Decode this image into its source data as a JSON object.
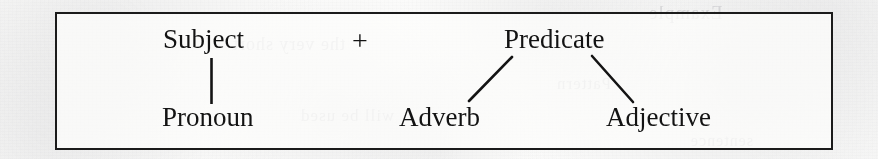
{
  "figure": {
    "type": "sentence-structure-tree",
    "caption_text": "",
    "border_color": "#1b1b1b",
    "text_color": "#131313",
    "background_color": "#fbfbfa"
  },
  "nodes": {
    "subject": "Subject",
    "plus": "+",
    "predicate": "Predicate",
    "pronoun": "Pronoun",
    "adverb": "Adverb",
    "adjective": "Adjective"
  },
  "connectors": [
    {
      "name": "subject-to-pronoun",
      "kind": "vertical",
      "from": "subject",
      "to": "pronoun"
    },
    {
      "name": "predicate-to-adverb",
      "kind": "diagonal-left",
      "from": "predicate",
      "to": "adverb"
    },
    {
      "name": "predicate-to-adjective",
      "kind": "diagonal-right",
      "from": "predicate",
      "to": "adjective"
    }
  ],
  "bleedthrough": {
    "line_a": "Example",
    "line_b": "the very short",
    "line_c": "Pattern",
    "line_d": "will be used",
    "line_e": "sentence"
  }
}
